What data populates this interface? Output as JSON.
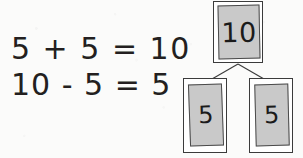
{
  "worksheet": {
    "background_color": "#fbfbfa",
    "ink_color": "#231f20"
  },
  "equations": {
    "line_1": "5 + 5 = 10",
    "line_2": "10 - 5 = 5"
  },
  "number_bond": {
    "card_fill_color": "#c9c9c9",
    "border_color": "#3b3b3b",
    "whole": {
      "value": "10",
      "role_label": "whole"
    },
    "parts": [
      {
        "value": "5",
        "role_label": "part-left"
      },
      {
        "value": "5",
        "role_label": "part-right"
      }
    ],
    "connectors": [
      {
        "name": "whole-to-part-left",
        "x1": 63,
        "y1": 64,
        "x2": 37,
        "y2": 79
      },
      {
        "name": "whole-to-part-right",
        "x1": 63,
        "y1": 64,
        "x2": 89,
        "y2": 79
      }
    ]
  }
}
